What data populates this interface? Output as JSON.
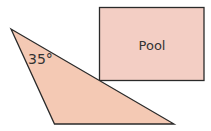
{
  "diagram": {
    "pool": {
      "label": "Pool",
      "fill": "#F3CEC4",
      "stroke": "#2a2a2a"
    },
    "triangle": {
      "angle_label": "35°",
      "fill": "#F4C9B4",
      "stroke": "#2a2a2a"
    }
  }
}
